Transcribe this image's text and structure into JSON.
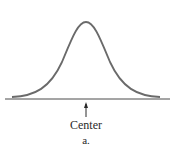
{
  "diagram": {
    "curve": "bell-curve",
    "labels": {
      "center": "Center",
      "caption": "a."
    },
    "colors": {
      "curve": "#6a6a6a",
      "axis": "#4a4a4a",
      "text": "#2a2a2a"
    }
  }
}
